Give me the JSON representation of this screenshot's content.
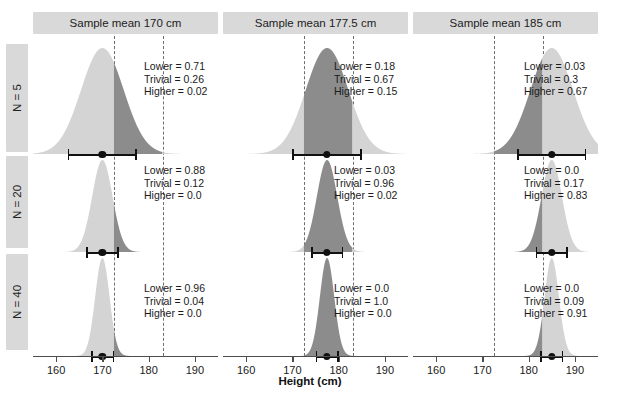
{
  "chart_data": {
    "type": "area",
    "title": "",
    "xlabel": "Height (cm)",
    "ylabel": "",
    "xlim": [
      155,
      195
    ],
    "xticks": [
      160,
      170,
      180,
      190
    ],
    "xticklabels": [
      "160",
      "170",
      "180",
      "190"
    ],
    "grid": false,
    "legend": "none",
    "colors": {
      "dark_fill": "#8c8c8c",
      "light_fill": "#d4d4d4",
      "strip_bg": "#d9d9d9",
      "dashed_line": "#6e6e6e",
      "interval": "#111111",
      "axis": "#4d4d4d"
    },
    "col_strips": [
      "Sample mean 170 cm",
      "Sample mean 177.5 cm",
      "Sample mean 185 cm"
    ],
    "row_strips": [
      "N = 5",
      "N = 20",
      "N = 40"
    ],
    "rope": {
      "note": "region of practical equivalence shown as dashed vertical lines",
      "lines_by_column": [
        [
          172.5,
          183.0
        ],
        [
          172.5,
          183.0
        ],
        [
          172.5,
          183.0
        ]
      ]
    },
    "panels": [
      {
        "column": 0,
        "row": 0,
        "sample_mean": 170,
        "n": 5,
        "mean": 170.0,
        "sd": 4.6,
        "ci_low": 162.5,
        "ci_high": 177.5,
        "annotation": {
          "lower": "Lower = 0.71",
          "trivial": "Trivial = 0.26",
          "higher": "Higher = 0.02"
        },
        "probabilities": {
          "lower": 0.71,
          "trivial": 0.26,
          "higher": 0.02
        }
      },
      {
        "column": 0,
        "row": 1,
        "sample_mean": 170,
        "n": 20,
        "mean": 170.0,
        "sd": 2.2,
        "ci_low": 166.5,
        "ci_high": 173.5,
        "annotation": {
          "lower": "Lower = 0.88",
          "trivial": "Trivial = 0.12",
          "higher": "Higher = 0.0"
        },
        "probabilities": {
          "lower": 0.88,
          "trivial": 0.12,
          "higher": 0.0
        }
      },
      {
        "column": 0,
        "row": 2,
        "sample_mean": 170,
        "n": 40,
        "mean": 170.0,
        "sd": 1.55,
        "ci_low": 167.5,
        "ci_high": 172.6,
        "annotation": {
          "lower": "Lower = 0.96",
          "trivial": "Trivial = 0.04",
          "higher": "Higher = 0.0"
        },
        "probabilities": {
          "lower": 0.96,
          "trivial": 0.04,
          "higher": 0.0
        }
      },
      {
        "column": 1,
        "row": 0,
        "sample_mean": 177.5,
        "n": 5,
        "mean": 177.5,
        "sd": 4.6,
        "ci_low": 170.0,
        "ci_high": 185.0,
        "annotation": {
          "lower": "Lower = 0.18",
          "trivial": "Trivial = 0.67",
          "higher": "Higher = 0.15"
        },
        "probabilities": {
          "lower": 0.18,
          "trivial": 0.67,
          "higher": 0.15
        }
      },
      {
        "column": 1,
        "row": 1,
        "sample_mean": 177.5,
        "n": 20,
        "mean": 177.5,
        "sd": 2.2,
        "ci_low": 174.0,
        "ci_high": 181.0,
        "annotation": {
          "lower": "Lower = 0.03",
          "trivial": "Trivial = 0.96",
          "higher": "Higher = 0.02"
        },
        "probabilities": {
          "lower": 0.03,
          "trivial": 0.96,
          "higher": 0.02
        }
      },
      {
        "column": 1,
        "row": 2,
        "sample_mean": 177.5,
        "n": 40,
        "mean": 177.5,
        "sd": 1.55,
        "ci_low": 175.0,
        "ci_high": 180.0,
        "annotation": {
          "lower": "Lower = 0.0",
          "trivial": "Trivial = 1.0",
          "higher": "Higher = 0.0"
        },
        "probabilities": {
          "lower": 0.0,
          "trivial": 1.0,
          "higher": 0.0
        }
      },
      {
        "column": 2,
        "row": 0,
        "sample_mean": 185,
        "n": 5,
        "mean": 185.0,
        "sd": 4.6,
        "ci_low": 177.5,
        "ci_high": 192.5,
        "annotation": {
          "lower": "Lower = 0.03",
          "trivial": "Trivial = 0.3",
          "higher": "Higher = 0.67"
        },
        "probabilities": {
          "lower": 0.03,
          "trivial": 0.3,
          "higher": 0.67
        }
      },
      {
        "column": 2,
        "row": 1,
        "sample_mean": 185,
        "n": 20,
        "mean": 185.0,
        "sd": 2.2,
        "ci_low": 181.5,
        "ci_high": 188.5,
        "annotation": {
          "lower": "Lower = 0.0",
          "trivial": "Trivial = 0.17",
          "higher": "Higher = 0.83"
        },
        "probabilities": {
          "lower": 0.0,
          "trivial": 0.17,
          "higher": 0.83
        }
      },
      {
        "column": 2,
        "row": 2,
        "sample_mean": 185,
        "n": 40,
        "mean": 185.0,
        "sd": 1.55,
        "ci_low": 182.5,
        "ci_high": 187.5,
        "annotation": {
          "lower": "Lower = 0.0",
          "trivial": "Trivial = 0.09",
          "higher": "Higher = 0.91"
        },
        "probabilities": {
          "lower": 0.0,
          "trivial": 0.09,
          "higher": 0.91
        }
      }
    ]
  }
}
